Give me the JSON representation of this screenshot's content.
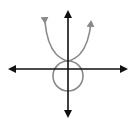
{
  "diagram": {
    "title": "",
    "colors": {
      "axes": "#111111",
      "curves": "#8a8a8a",
      "background": "#ffffff"
    },
    "elements": [
      {
        "kind": "x-axis",
        "arrows": "both"
      },
      {
        "kind": "y-axis",
        "arrows": "both"
      },
      {
        "kind": "parabola",
        "opens": "up",
        "arrows": "both-ends"
      },
      {
        "kind": "circle",
        "relation": "touches parabola vertex, centered on y-axis below origin"
      }
    ]
  }
}
